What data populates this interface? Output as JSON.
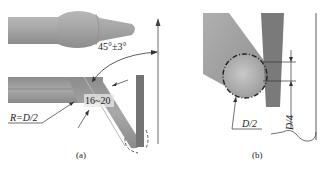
{
  "panels": [
    {
      "id": "a",
      "caption": "(a)",
      "annotations": {
        "angle_label": "45°±3°",
        "edge_angle_label": "16~20",
        "radius_label": "R=D/2"
      }
    },
    {
      "id": "b",
      "caption": "(b)",
      "annotations": {
        "radius_label": "D/2",
        "depth_label": "D/4"
      }
    }
  ],
  "colors": {
    "tool_body": "#9a9a9a",
    "tool_light": "#c4c4c4",
    "workpiece": "#707070",
    "line": "#333333"
  }
}
